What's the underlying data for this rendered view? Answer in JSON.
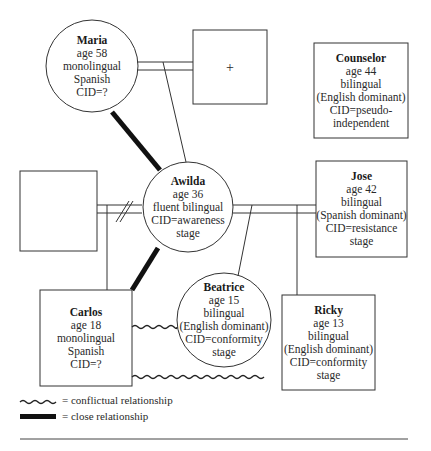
{
  "diagram": {
    "type": "genogram",
    "nodes": {
      "maria": {
        "name": "Maria",
        "lines": [
          "age 58",
          "monolingual Spanish",
          "CID=?"
        ],
        "shape": "circle"
      },
      "unknown_male_top": {
        "name": "",
        "lines": [
          "+"
        ],
        "shape": "square"
      },
      "counselor": {
        "name": "Counselor",
        "lines": [
          "age 44",
          "bilingual",
          "(English dominant)",
          "CID=pseudo-",
          "independent"
        ],
        "shape": "square"
      },
      "unknown_male_left": {
        "name": "",
        "lines": [],
        "shape": "square"
      },
      "awilda": {
        "name": "Awilda",
        "lines": [
          "age 36",
          "fluent bilingual",
          "CID=awareness",
          "stage"
        ],
        "shape": "circle"
      },
      "jose": {
        "name": "Jose",
        "lines": [
          "age 42",
          "bilingual",
          "(Spanish dominant)",
          "CID=resistance",
          "stage"
        ],
        "shape": "square"
      },
      "carlos": {
        "name": "Carlos",
        "lines": [
          "age 18",
          "monolingual",
          "Spanish",
          "CID=?"
        ],
        "shape": "square"
      },
      "beatrice": {
        "name": "Beatrice",
        "lines": [
          "age 15",
          "bilingual",
          "(English dominant)",
          "CID=conformity",
          "stage"
        ],
        "shape": "circle"
      },
      "ricky": {
        "name": "Ricky",
        "lines": [
          "age 13",
          "bilingual",
          "(English dominant)",
          "CID=conformity",
          "stage"
        ],
        "shape": "square"
      }
    },
    "legend": {
      "conflictual": "= conflictual relationship",
      "close": "= close relationship"
    }
  }
}
